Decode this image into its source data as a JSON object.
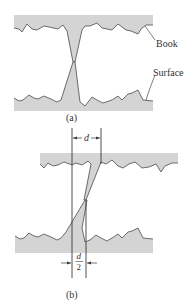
{
  "figure": {
    "panel_a": {
      "caption": "(a)",
      "labels": {
        "top": "Book",
        "bottom": "Surface"
      }
    },
    "panel_b": {
      "caption": "(b)",
      "dimension_top": "d",
      "dimension_bottom_num": "d",
      "dimension_bottom_den": "2"
    }
  },
  "colors": {
    "fill": "#d4d4d4",
    "stroke": "#4a4a4a",
    "text": "#333333"
  }
}
